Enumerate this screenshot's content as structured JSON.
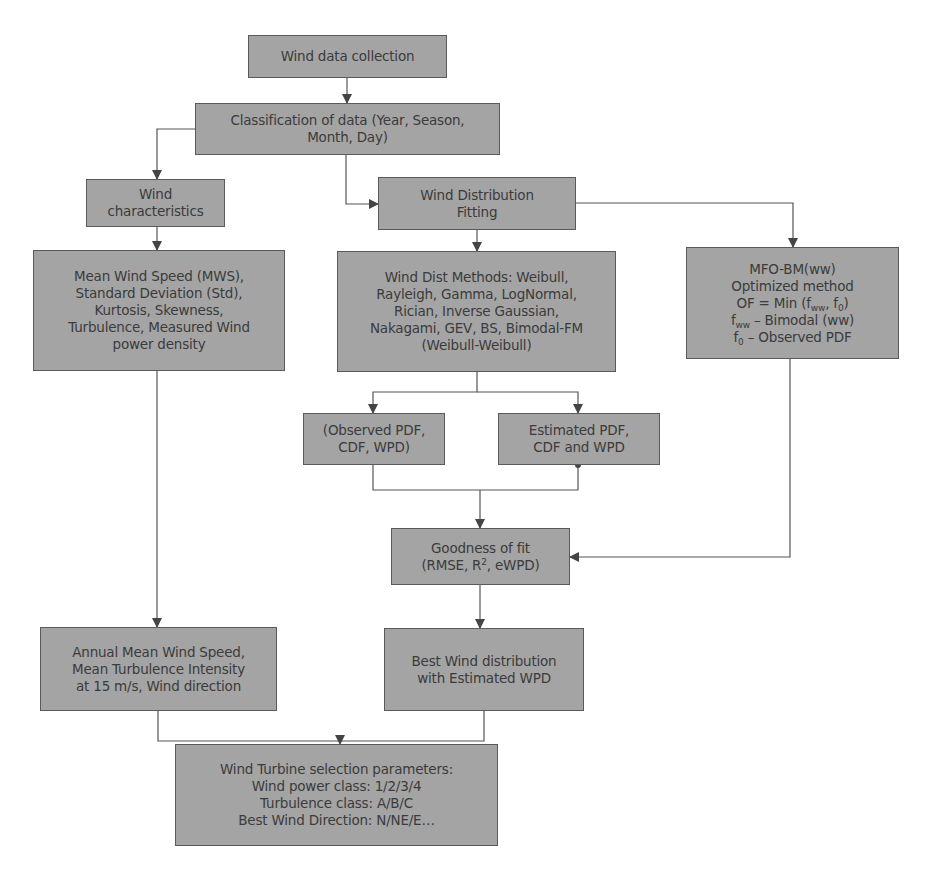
{
  "diagram": {
    "type": "flowchart",
    "colors": {
      "box_fill": "#a4a4a4",
      "box_border": "#5a5a5a",
      "text": "#3b3b3b",
      "connector": "#555555",
      "background": "#ffffff"
    },
    "nodes": {
      "collection": {
        "lines": [
          "Wind data collection"
        ]
      },
      "classification": {
        "lines": [
          "Classification of data (Year, Season,",
          "Month, Day)"
        ]
      },
      "characteristics": {
        "lines": [
          "Wind",
          "characteristics"
        ]
      },
      "fitting": {
        "lines": [
          "Wind Distribution",
          "Fitting"
        ]
      },
      "stats": {
        "lines": [
          "Mean Wind Speed (MWS),",
          "Standard Deviation (Std),",
          "Kurtosis, Skewness,",
          "Turbulence, Measured Wind",
          "power density"
        ]
      },
      "methods": {
        "lines": [
          "Wind Dist Methods: Weibull,",
          "Rayleigh, Gamma, LogNormal,",
          "Rician, Inverse Gaussian,",
          "Nakagami, GEV, BS, Bimodal-FM",
          "(Weibull-Weibull)"
        ]
      },
      "mfo": {
        "line1": "MFO-BM(ww)",
        "line2": "Optimized method",
        "line3_prefix": "OF = Min (f",
        "line3_sub1": "ww",
        "line3_mid": ", f",
        "line3_sub2": "0",
        "line3_suffix": ")",
        "line4_prefix": "f",
        "line4_sub": "ww",
        "line4_suffix": " – Bimodal (ww)",
        "line5_prefix": "f",
        "line5_sub": "0",
        "line5_suffix": " – Observed PDF"
      },
      "observed": {
        "lines": [
          "(Observed PDF,",
          "CDF, WPD)"
        ]
      },
      "estimated": {
        "lines": [
          "Estimated PDF,",
          "CDF and WPD"
        ]
      },
      "goodness": {
        "line1": "Goodness of fit",
        "line2_prefix": "(RMSE, R",
        "line2_sup": "2",
        "line2_suffix": ", eWPD)"
      },
      "annual": {
        "lines": [
          "Annual Mean Wind Speed,",
          "Mean Turbulence Intensity",
          "at 15 m/s, Wind direction"
        ]
      },
      "best": {
        "lines": [
          "Best Wind distribution",
          "with Estimated WPD"
        ]
      },
      "turbine": {
        "lines": [
          "Wind Turbine selection parameters:",
          "Wind power class: 1/2/3/4",
          "Turbulence class: A/B/C",
          "Best Wind Direction: N/NE/E…"
        ]
      }
    },
    "edges": [
      [
        "collection",
        "classification"
      ],
      [
        "classification",
        "characteristics"
      ],
      [
        "classification",
        "fitting"
      ],
      [
        "characteristics",
        "stats"
      ],
      [
        "fitting",
        "methods"
      ],
      [
        "fitting",
        "mfo"
      ],
      [
        "methods",
        "observed"
      ],
      [
        "methods",
        "estimated"
      ],
      [
        "observed",
        "goodness"
      ],
      [
        "estimated",
        "goodness"
      ],
      [
        "mfo",
        "goodness"
      ],
      [
        "stats",
        "annual"
      ],
      [
        "goodness",
        "best"
      ],
      [
        "annual",
        "turbine"
      ],
      [
        "best",
        "turbine"
      ]
    ]
  }
}
